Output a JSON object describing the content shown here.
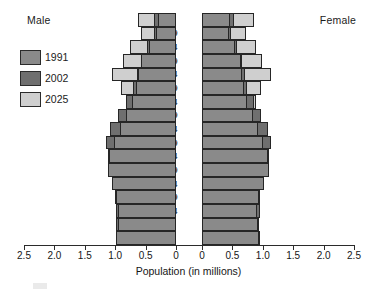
{
  "header": {
    "male_label": "Male",
    "female_label": "Female"
  },
  "legend": {
    "position": "top-left",
    "items": [
      {
        "label": "1991",
        "color": "#8a8a8a"
      },
      {
        "label": "2002",
        "color": "#6f6f6f"
      },
      {
        "label": "2025",
        "color": "#cfcfcf"
      }
    ]
  },
  "axis": {
    "xlabel": "Population (in millions)",
    "left_ticks": [
      "2.5",
      "2.0",
      "1.5",
      "1.0",
      "0.5",
      "0"
    ],
    "right_ticks": [
      "0",
      "0.5",
      "1.0",
      "1.5",
      "2.0",
      "2.5"
    ],
    "max": 2.5,
    "step": 0.5,
    "grid": false
  },
  "chart_data": {
    "type": "bar",
    "subtype": "population-pyramid",
    "title": "",
    "xlabel": "Population (in millions)",
    "ylabel": "",
    "xlim": [
      0,
      2.5
    ],
    "unit": "millions",
    "grid": false,
    "legend_position": "top-left",
    "categories": [
      "80+",
      "75-79",
      "70-74",
      "65-69",
      "60-64",
      "55-59",
      "50-54",
      "45-49",
      "40-44",
      "35-39",
      "30-34",
      "25-29",
      "20-24",
      "15-19",
      "10-14",
      "5-9",
      "0-4"
    ],
    "series": [
      {
        "name": "1991",
        "color": "#8a8a8a",
        "male": [
          0.3,
          0.33,
          0.45,
          0.57,
          0.62,
          0.66,
          0.72,
          0.83,
          0.92,
          1.02,
          1.1,
          1.12,
          1.05,
          0.98,
          0.95,
          0.96,
          0.98
        ],
        "female": [
          0.46,
          0.44,
          0.55,
          0.64,
          0.66,
          0.69,
          0.74,
          0.84,
          0.92,
          1.01,
          1.08,
          1.1,
          1.02,
          0.94,
          0.91,
          0.92,
          0.94
        ]
      },
      {
        "name": "2002",
        "color": "#6f6f6f",
        "male": [
          0.36,
          0.37,
          0.47,
          0.58,
          0.64,
          0.7,
          0.82,
          0.95,
          1.08,
          1.15,
          1.12,
          1.08,
          1.03,
          1.0,
          0.99,
          0.98,
          0.99
        ],
        "female": [
          0.52,
          0.48,
          0.57,
          0.66,
          0.7,
          0.74,
          0.85,
          0.97,
          1.08,
          1.14,
          1.1,
          1.06,
          1.0,
          0.96,
          0.95,
          0.94,
          0.95
        ]
      },
      {
        "name": "2025",
        "color": "#cfcfcf",
        "male": [
          0.62,
          0.57,
          0.76,
          0.88,
          1.06,
          0.9,
          0.82,
          0.88,
          0.95,
          1.0,
          1.02,
          1.04,
          1.0,
          0.97,
          0.96,
          0.96,
          0.97
        ],
        "female": [
          0.85,
          0.72,
          0.88,
          0.99,
          1.14,
          0.97,
          0.88,
          0.92,
          0.98,
          1.02,
          1.03,
          1.04,
          0.99,
          0.95,
          0.94,
          0.93,
          0.94
        ]
      }
    ]
  }
}
